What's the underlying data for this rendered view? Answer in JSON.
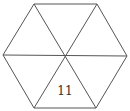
{
  "diagram": {
    "shape": "regular hexagon divided into 6 triangles",
    "vertices": {
      "top_left": [
        34,
        4
      ],
      "top_right": [
        97,
        4
      ],
      "right": [
        127,
        56
      ],
      "bottom_right": [
        96,
        108
      ],
      "bottom_left": [
        34,
        108
      ],
      "left": [
        3,
        55
      ]
    },
    "center": [
      65,
      56
    ],
    "triangles": [
      {
        "position": "top",
        "label": ""
      },
      {
        "position": "top-right",
        "label": ""
      },
      {
        "position": "bottom-right",
        "label": ""
      },
      {
        "position": "bottom",
        "label": "11"
      },
      {
        "position": "bottom-left",
        "label": ""
      },
      {
        "position": "top-left",
        "label": ""
      }
    ],
    "stroke_color": "#555555",
    "background_color": "#ffffff"
  }
}
